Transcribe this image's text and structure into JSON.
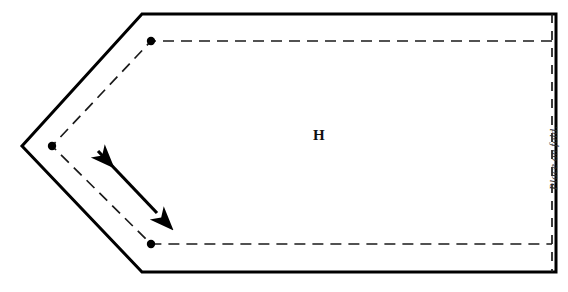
{
  "document": {
    "type": "sewing-pattern-piece",
    "background_color": "#ffffff",
    "width": 568,
    "height": 292
  },
  "labels": {
    "piece_letter": "H",
    "fold_instruction": "Place on fold."
  },
  "colors": {
    "cutting_line": "#000000",
    "stitching_line": "#1a1a1a",
    "dot": "#000000",
    "grainline": "#000000",
    "text": "#111111",
    "fold_text": "#2a2a2a"
  },
  "geometry": {
    "cutting_line": {
      "name": "cut-line",
      "style": "solid",
      "stroke_width": 3,
      "points": "142,14 556,14 556,272 142,272 22,146"
    },
    "stitching_line": {
      "name": "seam-line",
      "style": "dashed",
      "stroke_width": 1.7,
      "dash": "11 7",
      "points": "552,41 151,41 52,146 151,244 552,244"
    },
    "fold_line": {
      "name": "fold-edge",
      "style": "dashed",
      "stroke_width": 1.7,
      "dash": "9 8",
      "x": 552,
      "y1": 14,
      "y2": 272
    },
    "dots": [
      {
        "name": "match-dot-top",
        "cx": 151,
        "cy": 41,
        "r": 4.2
      },
      {
        "name": "match-dot-point",
        "cx": 52,
        "cy": 146,
        "r": 4.2
      },
      {
        "name": "match-dot-bottom",
        "cx": 151,
        "cy": 244,
        "r": 4.2
      }
    ],
    "grainline_arrow": {
      "name": "grainline",
      "x1": 157,
      "y1": 213,
      "x2": 98,
      "y2": 151,
      "stroke_width": 3.2,
      "head_length": 13,
      "head_width": 7
    }
  },
  "positions": {
    "piece_letter": {
      "left": 313,
      "top": 128
    },
    "fold_label": {
      "left": 547,
      "top": 190
    }
  }
}
